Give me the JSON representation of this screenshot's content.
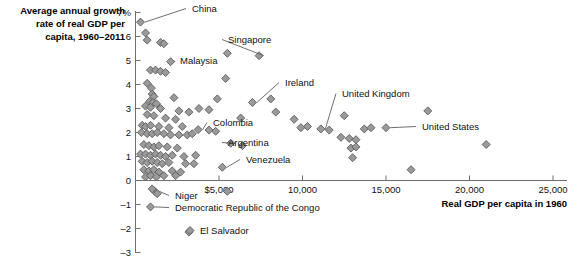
{
  "chart_data": {
    "type": "scatter",
    "title": "",
    "ylabel": "Average annual growth rate of real GDP per capita, 1960–2011",
    "ylabel_lines": [
      "Average annual growth",
      "rate of real GDP per",
      "capita, 1960–2011"
    ],
    "xlabel": "Real GDP per capita in 1960",
    "xlim": [
      0,
      25000
    ],
    "ylim": [
      -3,
      7
    ],
    "xticks": [
      5000,
      10000,
      15000,
      20000,
      25000
    ],
    "xtick_labels": [
      "$5,000",
      "10,000",
      "15,000",
      "20,000",
      "25,000"
    ],
    "yticks": [
      -3,
      -2,
      -1,
      0,
      1,
      2,
      3,
      4,
      5,
      6,
      7
    ],
    "ytick_labels": [
      "–3",
      "–2",
      "–1",
      "0",
      "1",
      "2",
      "3",
      "4",
      "5",
      "6",
      "7%"
    ],
    "grid": false,
    "legend": "none",
    "marker": "diamond",
    "marker_color": "#9a9a9a",
    "marker_edge_color": "#5b5b5b",
    "annotations": [
      {
        "label": "China",
        "x": 300,
        "y": 6.6,
        "text_x": 192,
        "text_y": 12,
        "anchor": "start"
      },
      {
        "label": "Singapore",
        "x": 7400,
        "y": 5.2,
        "text_x": 228,
        "text_y": 43,
        "anchor": "start"
      },
      {
        "label": "Malaysia",
        "x": 2100,
        "y": 4.95,
        "text_x": 180,
        "text_y": 64,
        "anchor": "start"
      },
      {
        "label": "Ireland",
        "x": 7000,
        "y": 3.25,
        "text_x": 285,
        "text_y": 86,
        "anchor": "start"
      },
      {
        "label": "United Kingdom",
        "x": 11100,
        "y": 2.15,
        "text_x": 342,
        "text_y": 97,
        "anchor": "start"
      },
      {
        "label": "Colombia",
        "x": 3750,
        "y": 2.12,
        "text_x": 213,
        "text_y": 126,
        "anchor": "start"
      },
      {
        "label": "United States",
        "x": 15000,
        "y": 2.2,
        "text_x": 422,
        "text_y": 130,
        "anchor": "start"
      },
      {
        "label": "Argentina",
        "x": 5700,
        "y": 1.55,
        "text_x": 228,
        "text_y": 146,
        "anchor": "start"
      },
      {
        "label": "Venezuela",
        "x": 5200,
        "y": 0.55,
        "text_x": 246,
        "text_y": 163,
        "anchor": "start"
      },
      {
        "label": "Niger",
        "x": 1150,
        "y": -0.45,
        "text_x": 175,
        "text_y": 199,
        "anchor": "start"
      },
      {
        "label": "Democratic Republic of the Congo",
        "x": 900,
        "y": -1.1,
        "text_x": 175,
        "text_y": 211,
        "anchor": "start"
      },
      {
        "label": "El Salvador",
        "x": 3200,
        "y": -2.15,
        "text_x": 200,
        "text_y": 234,
        "anchor": "start"
      }
    ],
    "points": [
      [
        300,
        6.6
      ],
      [
        600,
        6.15
      ],
      [
        700,
        5.85
      ],
      [
        1500,
        5.75
      ],
      [
        1700,
        5.7
      ],
      [
        7400,
        5.2
      ],
      [
        5500,
        5.3
      ],
      [
        2100,
        4.95
      ],
      [
        900,
        4.6
      ],
      [
        1200,
        4.6
      ],
      [
        1500,
        4.55
      ],
      [
        1800,
        4.5
      ],
      [
        5400,
        4.25
      ],
      [
        700,
        4.05
      ],
      [
        950,
        3.85
      ],
      [
        1000,
        3.6
      ],
      [
        1100,
        3.5
      ],
      [
        2300,
        3.45
      ],
      [
        4900,
        3.4
      ],
      [
        8100,
        3.4
      ],
      [
        850,
        3.3
      ],
      [
        1050,
        3.25
      ],
      [
        1250,
        3.2
      ],
      [
        7000,
        3.25
      ],
      [
        17500,
        2.9
      ],
      [
        600,
        3.1
      ],
      [
        900,
        3.05
      ],
      [
        1500,
        3.0
      ],
      [
        3800,
        3.0
      ],
      [
        4400,
        2.95
      ],
      [
        2600,
        2.9
      ],
      [
        3200,
        2.85
      ],
      [
        8400,
        2.85
      ],
      [
        12500,
        2.7
      ],
      [
        700,
        2.75
      ],
      [
        1100,
        2.7
      ],
      [
        1800,
        2.6
      ],
      [
        2400,
        2.55
      ],
      [
        6300,
        2.6
      ],
      [
        9500,
        2.55
      ],
      [
        400,
        2.3
      ],
      [
        600,
        2.25
      ],
      [
        900,
        2.3
      ],
      [
        1400,
        2.25
      ],
      [
        2000,
        2.2
      ],
      [
        2800,
        2.25
      ],
      [
        3750,
        2.12
      ],
      [
        4400,
        2.1
      ],
      [
        4800,
        2.05
      ],
      [
        9900,
        2.2
      ],
      [
        10300,
        2.25
      ],
      [
        11100,
        2.15
      ],
      [
        11600,
        2.1
      ],
      [
        13700,
        2.15
      ],
      [
        14100,
        2.2
      ],
      [
        15000,
        2.2
      ],
      [
        350,
        2.0
      ],
      [
        700,
        1.95
      ],
      [
        1000,
        1.95
      ],
      [
        1300,
        2.0
      ],
      [
        1700,
        1.95
      ],
      [
        2100,
        1.9
      ],
      [
        2600,
        1.9
      ],
      [
        3100,
        1.9
      ],
      [
        3400,
        1.95
      ],
      [
        12300,
        1.8
      ],
      [
        12800,
        1.75
      ],
      [
        13200,
        1.7
      ],
      [
        21000,
        1.5
      ],
      [
        5700,
        1.55
      ],
      [
        6400,
        1.45
      ],
      [
        500,
        1.5
      ],
      [
        800,
        1.45
      ],
      [
        1100,
        1.4
      ],
      [
        1400,
        1.45
      ],
      [
        1900,
        1.4
      ],
      [
        2500,
        1.35
      ],
      [
        12900,
        1.35
      ],
      [
        13200,
        1.4
      ],
      [
        300,
        1.1
      ],
      [
        600,
        1.1
      ],
      [
        900,
        1.05
      ],
      [
        1200,
        1.1
      ],
      [
        1500,
        1.05
      ],
      [
        1800,
        1.0
      ],
      [
        2200,
        1.05
      ],
      [
        2900,
        1.0
      ],
      [
        3600,
        1.05
      ],
      [
        13000,
        0.95
      ],
      [
        400,
        0.8
      ],
      [
        700,
        0.75
      ],
      [
        1000,
        0.8
      ],
      [
        1300,
        0.75
      ],
      [
        1600,
        0.7
      ],
      [
        2000,
        0.75
      ],
      [
        3000,
        0.7
      ],
      [
        3500,
        0.7
      ],
      [
        5200,
        0.55
      ],
      [
        16500,
        0.45
      ],
      [
        500,
        0.45
      ],
      [
        800,
        0.4
      ],
      [
        1100,
        0.45
      ],
      [
        1400,
        0.35
      ],
      [
        2200,
        0.4
      ],
      [
        2700,
        0.35
      ],
      [
        600,
        0.15
      ],
      [
        900,
        0.2
      ],
      [
        1250,
        0.15
      ],
      [
        1700,
        0.2
      ],
      [
        2400,
        0.2
      ],
      [
        1150,
        -0.45
      ],
      [
        1000,
        -0.35
      ],
      [
        1300,
        -0.55
      ],
      [
        5500,
        -0.45
      ],
      [
        900,
        -1.1
      ],
      [
        3200,
        -2.15
      ]
    ]
  }
}
